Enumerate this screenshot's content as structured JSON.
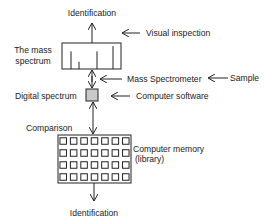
{
  "diagram": {
    "labels": {
      "identification_top": "Identification",
      "visual_inspection": "Visual inspection",
      "mass_spectrum_line1": "The mass",
      "mass_spectrum_line2": "spectrum",
      "mass_spectrometer": "Mass Spectrometer",
      "sample": "Sample",
      "digital_spectrum": "Digital spectrum",
      "computer_software": "Computer software",
      "comparison": "Comparison",
      "computer_memory_line1": "Computer memory",
      "computer_memory_line2": "(library)",
      "identification_bottom": "Identification"
    },
    "spectrum_peaks": [
      {
        "relative_height": 0.68
      },
      {
        "relative_height": 0.28
      },
      {
        "relative_height": 0.68
      },
      {
        "relative_height": 0.88
      }
    ],
    "library_grid": {
      "rows": 4,
      "columns": 7
    },
    "colors": {
      "stroke": "#222222",
      "digital_box_fill": "#c8c8c8"
    }
  }
}
